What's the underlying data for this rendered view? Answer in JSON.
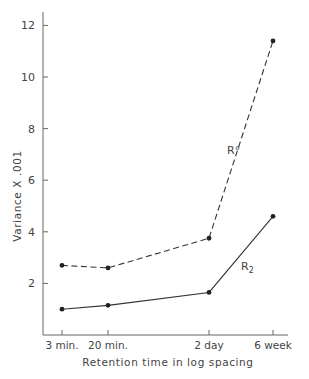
{
  "chart_data": {
    "type": "line",
    "title": "",
    "xlabel": "Retention time in log spacing",
    "ylabel": "Variance X .001",
    "categories": [
      "3 min.",
      "20 min.",
      "2 day",
      "6 week"
    ],
    "ylim": [
      0,
      12.5
    ],
    "yticks": [
      2,
      4,
      6,
      8,
      10,
      12
    ],
    "grid": false,
    "legend": "inline labels",
    "series": [
      {
        "name": "R°",
        "style": "dashed",
        "values": [
          2.7,
          2.6,
          3.75,
          11.4
        ]
      },
      {
        "name": "R₂",
        "style": "solid",
        "values": [
          1.0,
          1.15,
          1.65,
          4.6
        ]
      }
    ]
  },
  "labels": {
    "series_a": "R°",
    "series_b": "R",
    "series_b_sub": "2"
  }
}
